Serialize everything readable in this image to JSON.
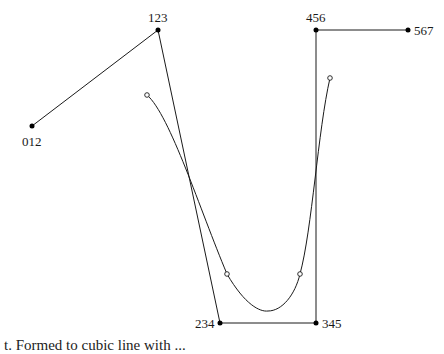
{
  "diagram": {
    "type": "polyline-with-curve",
    "colors": {
      "stroke": "#1a1a1a",
      "background": "#ffffff"
    },
    "control_points": [
      {
        "id": "p012",
        "label": "012",
        "x": 32,
        "y": 126,
        "label_pos": "below"
      },
      {
        "id": "p123",
        "label": "123",
        "x": 158,
        "y": 30,
        "label_pos": "above"
      },
      {
        "id": "p234",
        "label": "234",
        "x": 220,
        "y": 323,
        "label_pos": "left"
      },
      {
        "id": "p345",
        "label": "345",
        "x": 316,
        "y": 323,
        "label_pos": "right"
      },
      {
        "id": "p456",
        "label": "456",
        "x": 316,
        "y": 30,
        "label_pos": "above"
      },
      {
        "id": "p567",
        "label": "567",
        "x": 408,
        "y": 30,
        "label_pos": "right"
      }
    ],
    "curve_markers": [
      {
        "x": 147,
        "y": 95
      },
      {
        "x": 227,
        "y": 274
      },
      {
        "x": 300,
        "y": 274
      },
      {
        "x": 330,
        "y": 78
      }
    ]
  },
  "labels": {
    "p012": "012",
    "p123": "123",
    "p234": "234",
    "p345": "345",
    "p456": "456",
    "p567": "567"
  },
  "caption": "t. Formed to cubic line with ..."
}
